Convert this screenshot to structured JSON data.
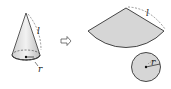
{
  "diagram": {
    "cone": {
      "slant_label": "l",
      "radius_label": "r"
    },
    "arrow": {
      "symbol": "⇨"
    },
    "net": {
      "sector": {
        "slant_label": "l"
      },
      "base_circle": {
        "radius_label": "r"
      }
    },
    "colors": {
      "fill": "#d6d6d6",
      "stroke": "#333333",
      "background": "#ffffff"
    }
  }
}
